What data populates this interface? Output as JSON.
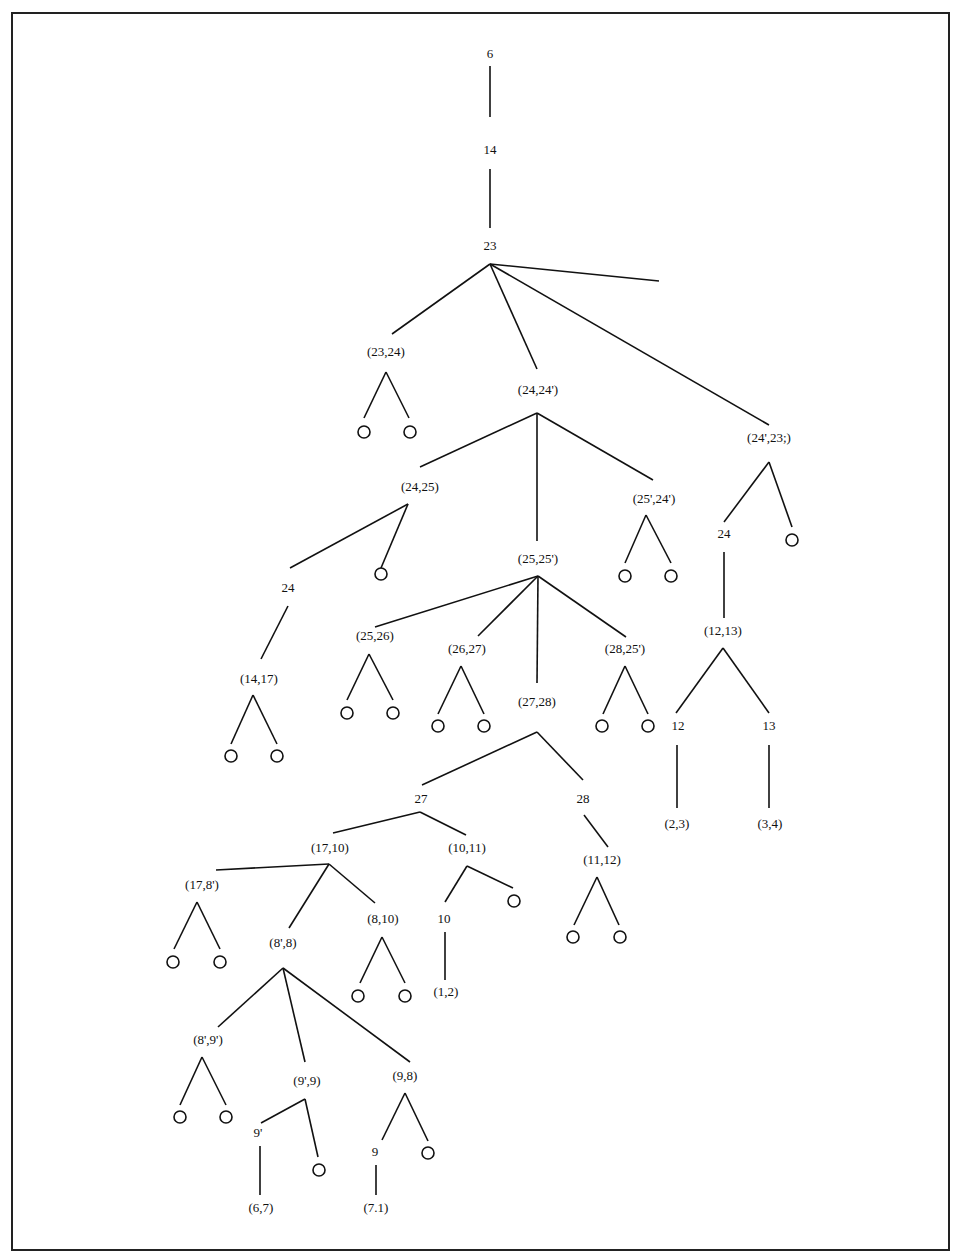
{
  "diagram": {
    "type": "search-tree",
    "nodes": [
      {
        "id": "n6",
        "label": "6",
        "x": 490,
        "y": 55
      },
      {
        "id": "n14",
        "label": "14",
        "x": 490,
        "y": 151
      },
      {
        "id": "n23",
        "label": "23",
        "x": 490,
        "y": 247
      },
      {
        "id": "n2324",
        "label": "(23,24)",
        "x": 386,
        "y": 353
      },
      {
        "id": "n2424p",
        "label": "(24,24')",
        "x": 538,
        "y": 391
      },
      {
        "id": "n24p23",
        "label": "(24',23;)",
        "x": 769,
        "y": 439
      },
      {
        "id": "n2425",
        "label": "(24,25)",
        "x": 420,
        "y": 488
      },
      {
        "id": "n25p24p",
        "label": "(25',24')",
        "x": 654,
        "y": 500
      },
      {
        "id": "n24b",
        "label": "24",
        "x": 724,
        "y": 535
      },
      {
        "id": "n2525p",
        "label": "(25,25')",
        "x": 538,
        "y": 560
      },
      {
        "id": "n24c",
        "label": "24",
        "x": 288,
        "y": 589
      },
      {
        "id": "n1213",
        "label": "(12,13)",
        "x": 723,
        "y": 632
      },
      {
        "id": "n2526",
        "label": "(25,26)",
        "x": 375,
        "y": 637
      },
      {
        "id": "n2627",
        "label": "(26,27)",
        "x": 467,
        "y": 650
      },
      {
        "id": "n2825p",
        "label": "(28,25')",
        "x": 625,
        "y": 650
      },
      {
        "id": "n1417",
        "label": "(14,17)",
        "x": 259,
        "y": 680
      },
      {
        "id": "n2728",
        "label": "(27,28)",
        "x": 537,
        "y": 703
      },
      {
        "id": "n12",
        "label": "12",
        "x": 678,
        "y": 727
      },
      {
        "id": "n13",
        "label": "13",
        "x": 769,
        "y": 727
      },
      {
        "id": "n27",
        "label": "27",
        "x": 421,
        "y": 800
      },
      {
        "id": "n28",
        "label": "28",
        "x": 583,
        "y": 800
      },
      {
        "id": "n23b",
        "label": "(2,3)",
        "x": 677,
        "y": 825
      },
      {
        "id": "n34",
        "label": "(3,4)",
        "x": 770,
        "y": 825
      },
      {
        "id": "n1710",
        "label": "(17,10)",
        "x": 330,
        "y": 849
      },
      {
        "id": "n1011",
        "label": "(10,11)",
        "x": 467,
        "y": 849
      },
      {
        "id": "n1112",
        "label": "(11,12)",
        "x": 602,
        "y": 861
      },
      {
        "id": "n178p",
        "label": "(17,8')",
        "x": 202,
        "y": 886
      },
      {
        "id": "n810",
        "label": "(8,10)",
        "x": 383,
        "y": 920
      },
      {
        "id": "n10",
        "label": "10",
        "x": 444,
        "y": 920
      },
      {
        "id": "n8p8",
        "label": "(8',8)",
        "x": 283,
        "y": 944
      },
      {
        "id": "n12b",
        "label": "(1,2)",
        "x": 446,
        "y": 993
      },
      {
        "id": "n8p9p",
        "label": "(8',9')",
        "x": 208,
        "y": 1041
      },
      {
        "id": "n98",
        "label": "(9,8)",
        "x": 405,
        "y": 1077
      },
      {
        "id": "n9p9",
        "label": "(9',9)",
        "x": 307,
        "y": 1082
      },
      {
        "id": "n9p",
        "label": "9'",
        "x": 258,
        "y": 1134
      },
      {
        "id": "n9",
        "label": "9",
        "x": 375,
        "y": 1153
      },
      {
        "id": "n67",
        "label": "(6,7)",
        "x": 261,
        "y": 1209
      },
      {
        "id": "n71",
        "label": "(7.1)",
        "x": 376,
        "y": 1209
      }
    ],
    "leaves": [
      {
        "x": 364,
        "y": 432
      },
      {
        "x": 410,
        "y": 432
      },
      {
        "x": 381,
        "y": 574
      },
      {
        "x": 625,
        "y": 576
      },
      {
        "x": 671,
        "y": 576
      },
      {
        "x": 792,
        "y": 540
      },
      {
        "x": 347,
        "y": 713
      },
      {
        "x": 393,
        "y": 713
      },
      {
        "x": 438,
        "y": 726
      },
      {
        "x": 484,
        "y": 726
      },
      {
        "x": 602,
        "y": 726
      },
      {
        "x": 648,
        "y": 726
      },
      {
        "x": 231,
        "y": 756
      },
      {
        "x": 277,
        "y": 756
      },
      {
        "x": 514,
        "y": 901
      },
      {
        "x": 573,
        "y": 937
      },
      {
        "x": 620,
        "y": 937
      },
      {
        "x": 173,
        "y": 962
      },
      {
        "x": 220,
        "y": 962
      },
      {
        "x": 358,
        "y": 996
      },
      {
        "x": 405,
        "y": 996
      },
      {
        "x": 180,
        "y": 1117
      },
      {
        "x": 226,
        "y": 1117
      },
      {
        "x": 319,
        "y": 1170
      },
      {
        "x": 428,
        "y": 1153
      }
    ],
    "edges": [
      [
        490,
        66,
        490,
        117
      ],
      [
        490,
        169,
        490,
        228
      ],
      [
        490,
        264,
        392,
        334
      ],
      [
        490,
        264,
        537,
        369
      ],
      [
        490,
        264,
        769,
        425
      ],
      [
        490,
        264,
        659,
        281
      ],
      [
        386,
        372,
        364,
        418
      ],
      [
        386,
        372,
        409,
        418
      ],
      [
        537,
        413,
        420,
        467
      ],
      [
        537,
        413,
        537,
        541
      ],
      [
        537,
        413,
        653,
        480
      ],
      [
        408,
        504,
        290,
        568
      ],
      [
        408,
        504,
        381,
        568
      ],
      [
        646,
        515,
        625,
        563
      ],
      [
        646,
        515,
        671,
        563
      ],
      [
        769,
        462,
        724,
        522
      ],
      [
        769,
        462,
        792,
        527
      ],
      [
        724,
        552,
        724,
        618
      ],
      [
        538,
        576,
        375,
        627
      ],
      [
        538,
        576,
        478,
        636
      ],
      [
        538,
        576,
        537,
        683
      ],
      [
        538,
        576,
        626,
        637
      ],
      [
        288,
        606,
        261,
        659
      ],
      [
        369,
        654,
        347,
        700
      ],
      [
        369,
        654,
        393,
        700
      ],
      [
        461,
        666,
        438,
        714
      ],
      [
        461,
        666,
        484,
        714
      ],
      [
        625,
        666,
        603,
        714
      ],
      [
        625,
        666,
        648,
        714
      ],
      [
        253,
        695,
        231,
        744
      ],
      [
        253,
        695,
        277,
        744
      ],
      [
        723,
        648,
        676,
        713
      ],
      [
        723,
        648,
        769,
        713
      ],
      [
        677,
        745,
        677,
        808
      ],
      [
        769,
        745,
        769,
        808
      ],
      [
        537,
        732,
        422,
        785
      ],
      [
        537,
        732,
        583,
        780
      ],
      [
        420,
        812,
        333,
        833
      ],
      [
        420,
        812,
        466,
        835
      ],
      [
        584,
        815,
        608,
        847
      ],
      [
        329,
        864,
        216,
        870
      ],
      [
        329,
        864,
        289,
        928
      ],
      [
        329,
        864,
        375,
        903
      ],
      [
        467,
        866,
        445,
        902
      ],
      [
        467,
        866,
        513,
        888
      ],
      [
        597,
        877,
        574,
        925
      ],
      [
        597,
        877,
        619,
        925
      ],
      [
        197,
        902,
        174,
        949
      ],
      [
        197,
        902,
        220,
        949
      ],
      [
        382,
        937,
        360,
        983
      ],
      [
        382,
        937,
        405,
        983
      ],
      [
        445,
        932,
        445,
        980
      ],
      [
        283,
        968,
        218,
        1027
      ],
      [
        283,
        968,
        305,
        1062
      ],
      [
        283,
        968,
        410,
        1062
      ],
      [
        202,
        1057,
        180,
        1105
      ],
      [
        202,
        1057,
        226,
        1105
      ],
      [
        305,
        1099,
        261,
        1123
      ],
      [
        305,
        1099,
        318,
        1157
      ],
      [
        405,
        1093,
        382,
        1140
      ],
      [
        405,
        1093,
        428,
        1141
      ],
      [
        260,
        1146,
        260,
        1195
      ],
      [
        376,
        1165,
        376,
        1195
      ]
    ]
  }
}
